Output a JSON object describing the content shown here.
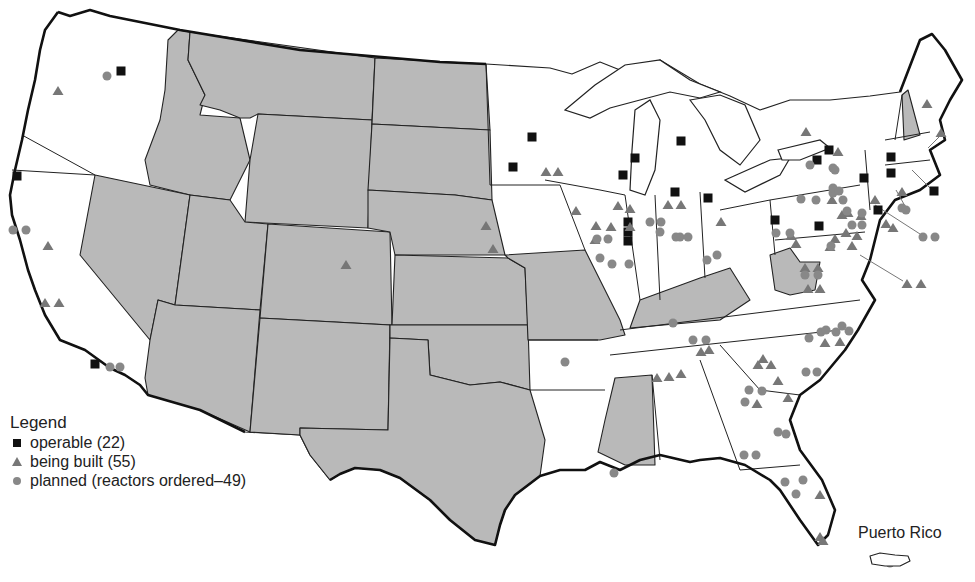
{
  "map": {
    "title": "Nuclear power plants in the United States",
    "region": "Contiguous United States",
    "colors": {
      "background": "#ffffff",
      "state_with_plants": "#ffffff",
      "state_without_plants": "#b9b9b9",
      "border": "#222222",
      "operable": "#111111",
      "being_built": "#777777",
      "planned": "#888888"
    }
  },
  "legend": {
    "title": "Legend",
    "items": [
      {
        "symbol": "square-icon",
        "label": "operable (22)",
        "count": 22
      },
      {
        "symbol": "triangle-icon",
        "label": "being built (55)",
        "count": 55
      },
      {
        "symbol": "circle-icon",
        "label": "planned (reactors ordered–49)",
        "count": 49
      }
    ]
  },
  "inset": {
    "label": "Puerto Rico",
    "markers": [
      "planned"
    ]
  },
  "shaded_states": [
    "Idaho",
    "Montana",
    "Wyoming",
    "Nevada",
    "Utah",
    "Colorado",
    "Arizona",
    "New Mexico",
    "North Dakota",
    "South Dakota",
    "Nebraska",
    "Kansas",
    "Oklahoma",
    "Texas",
    "Missouri",
    "Kentucky",
    "West Virginia",
    "Mississippi",
    "New Hampshire"
  ],
  "markers": {
    "operable": [
      [
        121,
        71
      ],
      [
        17,
        176
      ],
      [
        95,
        364
      ],
      [
        532,
        137
      ],
      [
        513,
        167
      ],
      [
        635,
        158
      ],
      [
        623,
        175
      ],
      [
        628,
        222
      ],
      [
        628,
        232
      ],
      [
        628,
        241
      ],
      [
        681,
        141
      ],
      [
        675,
        192
      ],
      [
        708,
        198
      ],
      [
        775,
        220
      ],
      [
        819,
        226
      ],
      [
        817,
        160
      ],
      [
        829,
        150
      ],
      [
        864,
        178
      ],
      [
        878,
        210
      ],
      [
        891,
        157
      ],
      [
        891,
        173
      ],
      [
        934,
        191
      ]
    ],
    "being_built": [
      [
        58,
        91
      ],
      [
        48,
        246
      ],
      [
        45,
        303
      ],
      [
        59,
        303
      ],
      [
        546,
        172
      ],
      [
        558,
        172
      ],
      [
        576,
        211
      ],
      [
        618,
        206
      ],
      [
        630,
        209
      ],
      [
        596,
        226
      ],
      [
        595,
        240
      ],
      [
        611,
        227
      ],
      [
        630,
        227
      ],
      [
        668,
        205
      ],
      [
        681,
        205
      ],
      [
        721,
        222
      ],
      [
        486,
        226
      ],
      [
        493,
        249
      ],
      [
        346,
        265
      ],
      [
        806,
        132
      ],
      [
        838,
        152
      ],
      [
        875,
        200
      ],
      [
        886,
        224
      ],
      [
        848,
        213
      ],
      [
        861,
        216
      ],
      [
        893,
        228
      ],
      [
        902,
        192
      ],
      [
        927,
        104
      ],
      [
        941,
        133
      ],
      [
        907,
        284
      ],
      [
        921,
        284
      ],
      [
        805,
        268
      ],
      [
        818,
        268
      ],
      [
        808,
        289
      ],
      [
        820,
        289
      ],
      [
        832,
        200
      ],
      [
        842,
        215
      ],
      [
        846,
        233
      ],
      [
        857,
        236
      ],
      [
        835,
        239
      ],
      [
        852,
        246
      ],
      [
        830,
        247
      ],
      [
        791,
        236
      ],
      [
        796,
        244
      ],
      [
        701,
        352
      ],
      [
        709,
        350
      ],
      [
        657,
        378
      ],
      [
        669,
        377
      ],
      [
        681,
        374
      ],
      [
        763,
        359
      ],
      [
        758,
        365
      ],
      [
        771,
        365
      ],
      [
        757,
        404
      ],
      [
        825,
        343
      ],
      [
        840,
        342
      ],
      [
        778,
        381
      ],
      [
        788,
        398
      ],
      [
        820,
        495
      ],
      [
        820,
        537
      ],
      [
        823,
        541
      ]
    ],
    "planned": [
      [
        107,
        76
      ],
      [
        13,
        230
      ],
      [
        26,
        230
      ],
      [
        110,
        367
      ],
      [
        120,
        367
      ],
      [
        597,
        239
      ],
      [
        608,
        239
      ],
      [
        600,
        258
      ],
      [
        612,
        264
      ],
      [
        629,
        264
      ],
      [
        650,
        222
      ],
      [
        661,
        222
      ],
      [
        680,
        237
      ],
      [
        688,
        237
      ],
      [
        660,
        232
      ],
      [
        676,
        237
      ],
      [
        707,
        260
      ],
      [
        717,
        255
      ],
      [
        776,
        233
      ],
      [
        790,
        233
      ],
      [
        801,
        199
      ],
      [
        816,
        200
      ],
      [
        833,
        193
      ],
      [
        843,
        200
      ],
      [
        847,
        211
      ],
      [
        862,
        213
      ],
      [
        810,
        165
      ],
      [
        833,
        168
      ],
      [
        835,
        170
      ],
      [
        833,
        188
      ],
      [
        839,
        191
      ],
      [
        852,
        225
      ],
      [
        862,
        225
      ],
      [
        831,
        246
      ],
      [
        805,
        275
      ],
      [
        818,
        275
      ],
      [
        923,
        237
      ],
      [
        935,
        237
      ],
      [
        902,
        208
      ],
      [
        906,
        210
      ],
      [
        565,
        362
      ],
      [
        693,
        340
      ],
      [
        706,
        340
      ],
      [
        673,
        323
      ],
      [
        778,
        432
      ],
      [
        786,
        434
      ],
      [
        806,
        372
      ],
      [
        817,
        372
      ],
      [
        821,
        332
      ],
      [
        826,
        330
      ],
      [
        836,
        332
      ],
      [
        849,
        331
      ],
      [
        842,
        326
      ],
      [
        809,
        338
      ],
      [
        749,
        390
      ],
      [
        762,
        391
      ],
      [
        745,
        402
      ],
      [
        744,
        455
      ],
      [
        756,
        455
      ],
      [
        614,
        473
      ],
      [
        785,
        482
      ],
      [
        796,
        494
      ],
      [
        803,
        480
      ],
      [
        890,
        563
      ]
    ]
  }
}
